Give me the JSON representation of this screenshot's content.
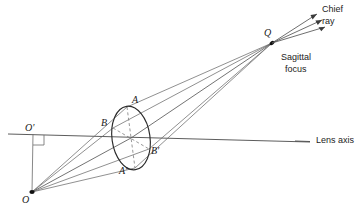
{
  "figure": {
    "background_color": "#ffffff",
    "line_color": "#3a3a3a",
    "ink_color": "#1a1a1a",
    "width": 364,
    "height": 217
  },
  "labels": {
    "object_point": "O",
    "axis_foot_point": "O'",
    "aperture_top": "A",
    "aperture_bottom": "A'",
    "aperture_left": "B",
    "aperture_right": "B'",
    "focus_point": "Q",
    "lens_axis": "Lens axis",
    "chief_ray_line1": "Chief",
    "chief_ray_line2": "ray",
    "sagittal_line1": "Sagittal",
    "sagittal_line2": "focus"
  },
  "geometry": {
    "object_point": {
      "x": 32,
      "y": 192
    },
    "axis_foot_point": {
      "x": 33,
      "y": 136
    },
    "lens_center": {
      "x": 131,
      "y": 138
    },
    "focus_point": {
      "x": 272,
      "y": 43
    },
    "aperture_top": {
      "x": 127,
      "y": 107
    },
    "aperture_bottom": {
      "x": 135,
      "y": 168
    },
    "aperture_left": {
      "x": 113,
      "y": 128
    },
    "aperture_right": {
      "x": 149,
      "y": 149
    },
    "axis_start": {
      "x": 8,
      "y": 134
    },
    "axis_end": {
      "x": 310,
      "y": 142
    },
    "ellipse": {
      "cx": 131,
      "cy": 138,
      "rx": 19,
      "ry": 32,
      "rotation": -8
    }
  },
  "rays": [
    {
      "name": "ray-O-to-A",
      "from": "O",
      "through": "A",
      "to": "Q"
    },
    {
      "name": "ray-O-to-B",
      "from": "O",
      "through": "B",
      "to": "Q"
    },
    {
      "name": "ray-O-to-center",
      "from": "O",
      "through": "lens-center",
      "to": "Q"
    },
    {
      "name": "ray-O-to-Bprime",
      "from": "O",
      "through": "B'",
      "to": "Q"
    },
    {
      "name": "ray-O-to-Aprime",
      "from": "O",
      "through": "A'",
      "to": "Q"
    }
  ],
  "arrows": {
    "count": 3,
    "direction": "up-right from Q toward chief ray label"
  }
}
